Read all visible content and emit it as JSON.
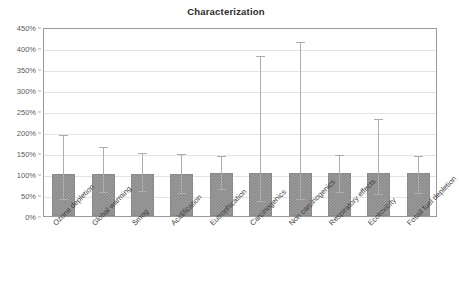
{
  "chart_data": {
    "type": "bar",
    "title": "Characterization",
    "xlabel": "",
    "ylabel": "",
    "ylim": [
      0,
      450
    ],
    "yunit": "%",
    "ytick_labels": [
      "0%",
      "50%",
      "100%",
      "150%",
      "200%",
      "250%",
      "300%",
      "350%",
      "400%",
      "450%"
    ],
    "yticks": [
      0,
      50,
      100,
      150,
      200,
      250,
      300,
      350,
      400,
      450
    ],
    "grid": true,
    "legend": "none",
    "categories": [
      "Ozone depletion",
      "Global warming",
      "Smog",
      "Acidification",
      "Eutrophication",
      "Carcinogenics",
      "Non carcinogenics",
      "Respiratory effects",
      "Ecotoxicity",
      "Fossil fuel depletion"
    ],
    "series": [
      {
        "name": "Characterization",
        "values": [
          100,
          100,
          100,
          100,
          103,
          103,
          103,
          103,
          103,
          103
        ],
        "error_upper": [
          198,
          170,
          155,
          152,
          148,
          385,
          420,
          150,
          235,
          148
        ],
        "error_lower": [
          45,
          62,
          65,
          60,
          68,
          40,
          45,
          62,
          58,
          60
        ]
      }
    ]
  },
  "axis": {
    "bar_color": "#9b9b9b",
    "error_color": "#adadad",
    "grid_color": "#e4e4e4",
    "frame_color": "#9a9a9a",
    "text_color": "#3d3d3d"
  }
}
